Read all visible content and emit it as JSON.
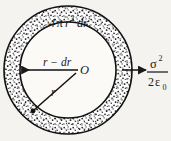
{
  "figure": {
    "kind": "spherical-shell-cross-section",
    "background_color": "#f4f3ef",
    "ink_color": "#1a1a1a",
    "center": {
      "label": "O",
      "x": 68,
      "y": 70
    },
    "outer_radius": 64,
    "inner_radius": 48,
    "shading": "stipple"
  },
  "labels": {
    "area_element": {
      "text": "4πr  dr",
      "lead": "4",
      "pi": "π",
      "r": "r",
      "exponent": "2",
      "differential": "dr"
    },
    "inner_radius_label": {
      "r": "r",
      "minus": "−",
      "dr": "dr",
      "full": "r − dr"
    },
    "outer_radius_label": {
      "r": "r"
    },
    "center_label": {
      "text": "O"
    },
    "pressure": {
      "numerator_symbol": "σ",
      "numerator_exponent": "2",
      "denominator_lead": "2",
      "denominator_symbol": "ε",
      "denominator_subscript": "0",
      "full": "σ² / 2ε₀"
    }
  },
  "arrows": {
    "inner": {
      "name": "inner-radius-arrow",
      "direction": "left"
    },
    "outer": {
      "name": "pressure-arrow",
      "direction": "right"
    }
  }
}
